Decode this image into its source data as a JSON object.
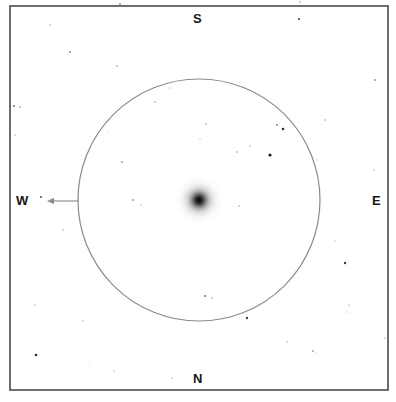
{
  "chart": {
    "kind": "astronomical-finder-chart",
    "background_color": "#ffffff",
    "frame": {
      "x": 10,
      "y": 6,
      "width": 378,
      "height": 384,
      "stroke_color": "#4a4a4a",
      "stroke_width": 1.6
    },
    "field_circle": {
      "center_x": 199,
      "center_y": 200,
      "radius": 121,
      "stroke_color": "#8a8a8a",
      "stroke_width": 1.2,
      "fill": "none"
    },
    "direction_arrow": {
      "label": "motion-arrow",
      "from_x": 78,
      "from_y": 201,
      "to_x": 47,
      "to_y": 201,
      "color": "#8e8e8e",
      "stroke_width": 1.2,
      "head_length": 7,
      "head_half_width": 3.2,
      "points_toward": "W"
    },
    "compass": {
      "top": "S",
      "bottom": "N",
      "left": "W",
      "right": "E",
      "text_color": "#161616",
      "font_size_px": 13
    },
    "central_object": {
      "name": "diffuse-nebulous-object",
      "center_x": 199,
      "center_y": 200,
      "core_radius": 9,
      "halo_radius": 32,
      "core_color": "#111111",
      "halo_color": "#d8d8d8"
    },
    "stars": [
      {
        "x": 299,
        "y": 19,
        "r": 1.0,
        "color": "#3c3c3c"
      },
      {
        "x": 50,
        "y": 25,
        "r": 0.8,
        "color": "#a8a8a8"
      },
      {
        "x": 70,
        "y": 52,
        "r": 0.9,
        "color": "#7a7a7a"
      },
      {
        "x": 68,
        "y": 54,
        "r": 0.6,
        "color": "#b4b4b4"
      },
      {
        "x": 375,
        "y": 80,
        "r": 0.9,
        "color": "#909090"
      },
      {
        "x": 117,
        "y": 66,
        "r": 0.8,
        "color": "#8c8c8c"
      },
      {
        "x": 170,
        "y": 88,
        "r": 0.7,
        "color": "#b0b0b0"
      },
      {
        "x": 14,
        "y": 106,
        "r": 1.0,
        "color": "#6e6e6e"
      },
      {
        "x": 20,
        "y": 107,
        "r": 0.8,
        "color": "#8a8a8a"
      },
      {
        "x": 155,
        "y": 102,
        "r": 0.8,
        "color": "#9a9a9a"
      },
      {
        "x": 206,
        "y": 124,
        "r": 0.8,
        "color": "#9a9a9a"
      },
      {
        "x": 277,
        "y": 125,
        "r": 0.9,
        "color": "#7c7c7c"
      },
      {
        "x": 325,
        "y": 120,
        "r": 0.8,
        "color": "#a0a0a0"
      },
      {
        "x": 283,
        "y": 129,
        "r": 1.3,
        "color": "#2e2e2e"
      },
      {
        "x": 200,
        "y": 139,
        "r": 0.7,
        "color": "#b4b4b4"
      },
      {
        "x": 237,
        "y": 152,
        "r": 0.8,
        "color": "#9c9c9c"
      },
      {
        "x": 15,
        "y": 135,
        "r": 0.8,
        "color": "#b0b0b0"
      },
      {
        "x": 250,
        "y": 146,
        "r": 0.8,
        "color": "#a6a6a6"
      },
      {
        "x": 270,
        "y": 155,
        "r": 1.6,
        "color": "#202020"
      },
      {
        "x": 374,
        "y": 170,
        "r": 0.8,
        "color": "#aeaeae"
      },
      {
        "x": 122,
        "y": 162,
        "r": 0.9,
        "color": "#9a9a9a"
      },
      {
        "x": 133,
        "y": 200,
        "r": 0.9,
        "color": "#8c8c8c"
      },
      {
        "x": 41,
        "y": 197,
        "r": 1.0,
        "color": "#4a4a4a"
      },
      {
        "x": 141,
        "y": 205,
        "r": 0.7,
        "color": "#b2b2b2"
      },
      {
        "x": 239,
        "y": 206,
        "r": 0.8,
        "color": "#989898"
      },
      {
        "x": 63,
        "y": 230,
        "r": 0.8,
        "color": "#a2a2a2"
      },
      {
        "x": 345,
        "y": 263,
        "r": 1.2,
        "color": "#3a3a3a"
      },
      {
        "x": 335,
        "y": 241,
        "r": 0.7,
        "color": "#b6b6b6"
      },
      {
        "x": 35,
        "y": 305,
        "r": 0.8,
        "color": "#b4b4b4"
      },
      {
        "x": 205,
        "y": 296,
        "r": 1.0,
        "color": "#6a6a6a"
      },
      {
        "x": 212,
        "y": 298,
        "r": 0.8,
        "color": "#a0a0a0"
      },
      {
        "x": 83,
        "y": 321,
        "r": 0.8,
        "color": "#b0b0b0"
      },
      {
        "x": 247,
        "y": 318,
        "r": 1.2,
        "color": "#3e3e3e"
      },
      {
        "x": 349,
        "y": 305,
        "r": 0.8,
        "color": "#b6b6b6"
      },
      {
        "x": 347,
        "y": 312,
        "r": 0.7,
        "color": "#c0c0c0"
      },
      {
        "x": 36,
        "y": 355,
        "r": 1.3,
        "color": "#2a2a2a"
      },
      {
        "x": 114,
        "y": 371,
        "r": 0.8,
        "color": "#b2b2b2"
      },
      {
        "x": 172,
        "y": 378,
        "r": 0.8,
        "color": "#b8b8b8"
      },
      {
        "x": 313,
        "y": 351,
        "r": 0.9,
        "color": "#9c9c9c"
      },
      {
        "x": 316,
        "y": 353,
        "r": 0.6,
        "color": "#bcbcbc"
      },
      {
        "x": 385,
        "y": 338,
        "r": 0.8,
        "color": "#a8a8a8"
      },
      {
        "x": 287,
        "y": 342,
        "r": 0.8,
        "color": "#a8a8a8"
      },
      {
        "x": 90,
        "y": 362,
        "r": 0.6,
        "color": "#c2c2c2"
      },
      {
        "x": 160,
        "y": 256,
        "r": 0.6,
        "color": "#c0c0c0"
      },
      {
        "x": 108,
        "y": 131,
        "r": 0.6,
        "color": "#c4c4c4"
      },
      {
        "x": 317,
        "y": 160,
        "r": 0.7,
        "color": "#b8b8b8"
      },
      {
        "x": 120,
        "y": 4,
        "r": 0.9,
        "color": "#8a8a8a"
      },
      {
        "x": 300,
        "y": 2,
        "r": 0.8,
        "color": "#9e9e9e"
      }
    ]
  }
}
